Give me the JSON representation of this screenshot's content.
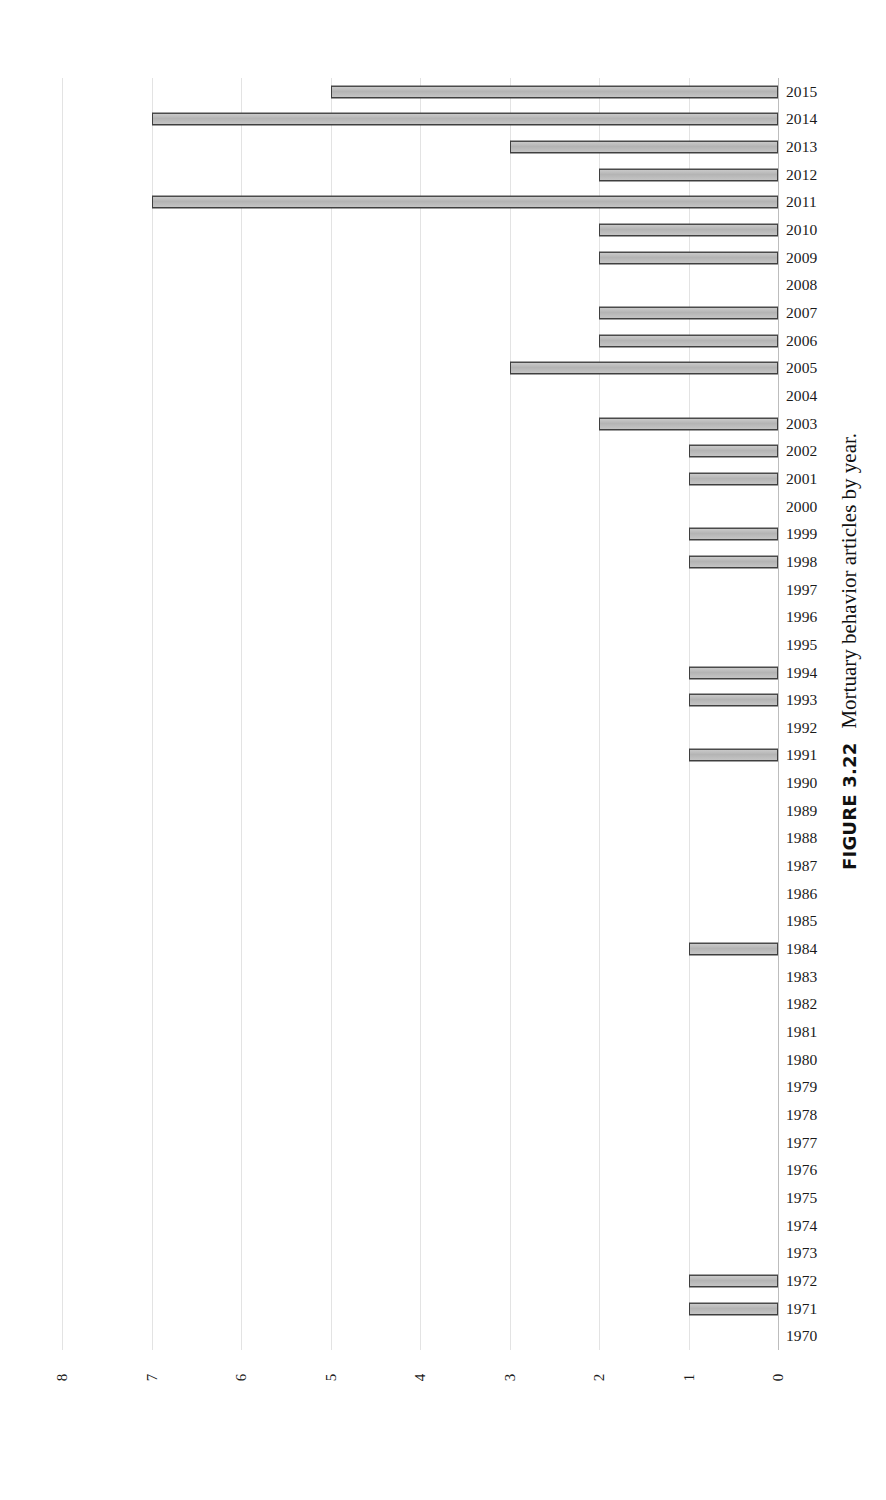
{
  "caption": {
    "label": "FIGURE 3.22",
    "text": "Mortuary behavior articles by year."
  },
  "chart_data": {
    "type": "bar",
    "orientation": "horizontal",
    "title": "",
    "subtitle": "",
    "xlabel": "",
    "ylabel": "",
    "xlim": [
      8,
      0
    ],
    "x_axis_reversed": true,
    "x_ticks": [
      "8",
      "7",
      "6",
      "5",
      "4",
      "3",
      "2",
      "1",
      "0"
    ],
    "x_tick_values": [
      8,
      7,
      6,
      5,
      4,
      3,
      2,
      1,
      0
    ],
    "grid": "vertical",
    "legend": "none",
    "bar_fill_color": "#c0c0c0",
    "bar_edge_color": "#404040",
    "gridline_color": "#e3e3e3",
    "categories": [
      "2015",
      "2014",
      "2013",
      "2012",
      "2011",
      "2010",
      "2009",
      "2008",
      "2007",
      "2006",
      "2005",
      "2004",
      "2003",
      "2002",
      "2001",
      "2000",
      "1999",
      "1998",
      "1997",
      "1996",
      "1995",
      "1994",
      "1993",
      "1992",
      "1991",
      "1990",
      "1989",
      "1988",
      "1987",
      "1986",
      "1985",
      "1984",
      "1983",
      "1982",
      "1981",
      "1980",
      "1979",
      "1978",
      "1977",
      "1976",
      "1975",
      "1974",
      "1973",
      "1972",
      "1971",
      "1970"
    ],
    "values": [
      5,
      7,
      3,
      2,
      7,
      2,
      2,
      0,
      2,
      2,
      3,
      0,
      2,
      1,
      1,
      0,
      1,
      1,
      0,
      0,
      0,
      1,
      1,
      0,
      1,
      0,
      0,
      0,
      0,
      0,
      0,
      1,
      0,
      0,
      0,
      0,
      0,
      0,
      0,
      0,
      0,
      0,
      0,
      1,
      1,
      0
    ]
  }
}
